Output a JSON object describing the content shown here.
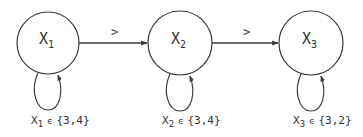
{
  "diagram": {
    "type": "constraint-graph",
    "stroke_color": "#3a3a3a",
    "nodes": [
      {
        "id": "x1",
        "variable": "X",
        "subscript": "1",
        "domain_symbol": "ϵ",
        "domain": "{3,4}",
        "cx": 48,
        "cy": 43,
        "r": 31
      },
      {
        "id": "x2",
        "variable": "X",
        "subscript": "2",
        "domain_symbol": "ϵ",
        "domain": "{3,4}",
        "cx": 180,
        "cy": 43,
        "r": 32
      },
      {
        "id": "x3",
        "variable": "X",
        "subscript": "3",
        "domain_symbol": "ϵ",
        "domain": "{3,2}",
        "cx": 311,
        "cy": 43,
        "r": 32
      }
    ],
    "edges": [
      {
        "from": "x1",
        "to": "x2",
        "label": ">"
      },
      {
        "from": "x2",
        "to": "x3",
        "label": ">"
      }
    ]
  }
}
